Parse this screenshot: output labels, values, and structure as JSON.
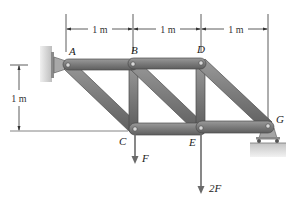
{
  "diagram": {
    "type": "truss",
    "nodes": [
      {
        "id": "A",
        "label": "A",
        "x": 68,
        "y": 65
      },
      {
        "id": "B",
        "label": "B",
        "x": 133,
        "y": 64
      },
      {
        "id": "D",
        "label": "D",
        "x": 201,
        "y": 63
      },
      {
        "id": "C",
        "label": "C",
        "x": 135,
        "y": 129
      },
      {
        "id": "E",
        "label": "E",
        "x": 201,
        "y": 129
      },
      {
        "id": "G",
        "label": "G",
        "x": 268,
        "y": 126
      }
    ],
    "members": [
      [
        "A",
        "B"
      ],
      [
        "B",
        "D"
      ],
      [
        "C",
        "E"
      ],
      [
        "E",
        "G"
      ],
      [
        "A",
        "C"
      ],
      [
        "B",
        "C"
      ],
      [
        "B",
        "E"
      ],
      [
        "D",
        "E"
      ],
      [
        "D",
        "G"
      ]
    ],
    "dimensions": {
      "horizontal": [
        "1 m",
        "1 m",
        "1 m"
      ],
      "vertical": "1 m"
    },
    "loads": [
      {
        "at": "C",
        "label": "F"
      },
      {
        "at": "E",
        "label": "2F"
      }
    ],
    "supports": {
      "A": "wall pin",
      "G": "roller"
    },
    "colors": {
      "member": "#7d7d7d",
      "member_edge": "#4a4a4a",
      "wall": "#c9c9c9",
      "ground": "#cfcfcf",
      "arrow": "#6a6a6a"
    }
  }
}
